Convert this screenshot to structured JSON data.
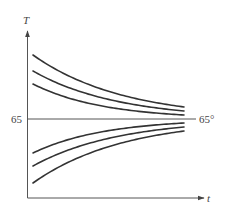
{
  "figure": {
    "y_axis_label": "T",
    "x_axis_label": "t",
    "reference_value_label": "65",
    "reference_degree_label": "65°",
    "colors": {
      "axis": "#555555",
      "curve": "#333333",
      "text": "#444444"
    }
  },
  "geometry": {
    "origin": [
      27.5,
      198
    ],
    "y_axis_top": 30,
    "x_axis_right": 205,
    "reference_y": 119,
    "curve_x_start": 33,
    "curve_x_end": 184,
    "ref_line_right": 196
  },
  "curves": [
    {
      "name": "curve-upper-1",
      "start_offset": -64,
      "end_offset": -12,
      "rate": 0.011
    },
    {
      "name": "curve-upper-2",
      "start_offset": -48,
      "end_offset": -8,
      "rate": 0.0118
    },
    {
      "name": "curve-upper-3",
      "start_offset": -35,
      "end_offset": -4,
      "rate": 0.0144
    },
    {
      "name": "curve-lower-1",
      "start_offset": 34,
      "end_offset": 4,
      "rate": 0.0142
    },
    {
      "name": "curve-lower-2",
      "start_offset": 47,
      "end_offset": 8,
      "rate": 0.0117
    },
    {
      "name": "curve-lower-3",
      "start_offset": 64,
      "end_offset": 12,
      "rate": 0.011
    }
  ]
}
